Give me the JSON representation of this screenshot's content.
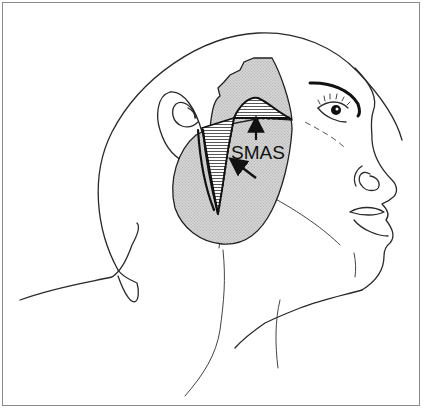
{
  "figure": {
    "type": "medical-illustration",
    "labels": [
      {
        "id": "smas",
        "text": "SMAS"
      }
    ],
    "colors": {
      "line": "#2a2a2a",
      "stipple": "#c8c8c8",
      "background": "#ffffff",
      "frame": "#8a8a8a"
    },
    "arrows": [
      {
        "id": "arrow-up",
        "direction": "up"
      },
      {
        "id": "arrow-upper-left",
        "direction": "up-left"
      }
    ]
  }
}
